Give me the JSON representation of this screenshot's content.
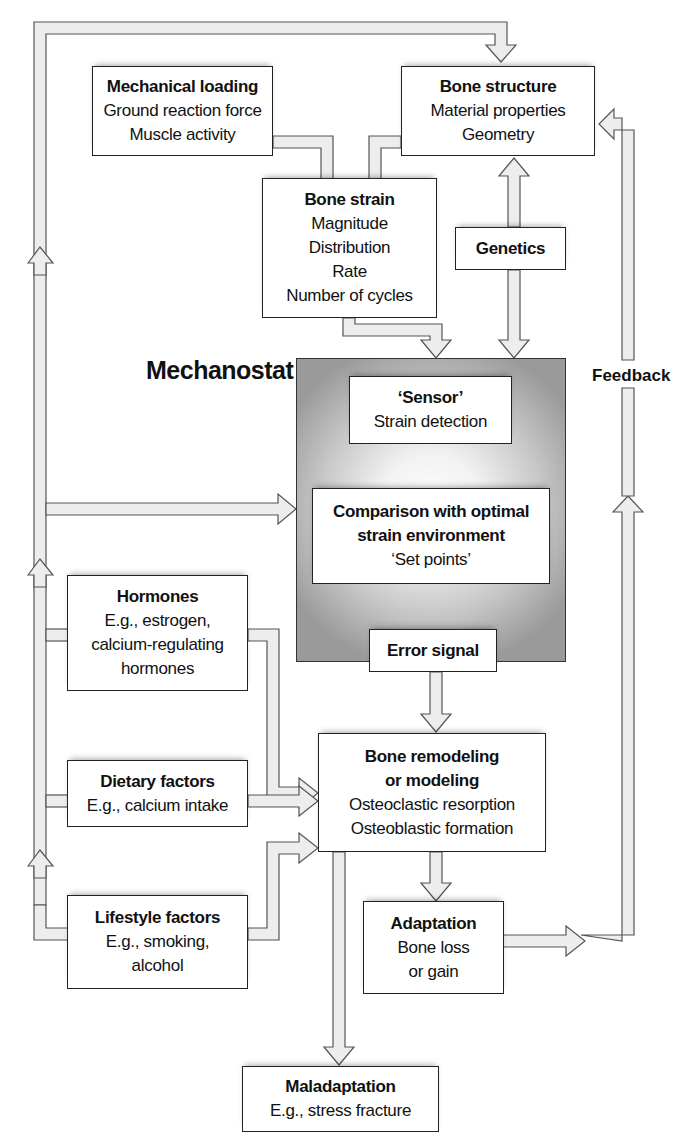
{
  "diagram": {
    "title": "Mechanostat",
    "feedback_label": "Feedback",
    "nodes": {
      "mechanical_loading": {
        "title": "Mechanical loading",
        "lines": [
          "Ground reaction force",
          "Muscle activity"
        ]
      },
      "bone_structure": {
        "title": "Bone structure",
        "lines": [
          "Material properties",
          "Geometry"
        ]
      },
      "bone_strain": {
        "title": "Bone strain",
        "lines": [
          "Magnitude",
          "Distribution",
          "Rate",
          "Number of cycles"
        ]
      },
      "genetics": {
        "title": "Genetics",
        "lines": []
      },
      "sensor": {
        "title": "‘Sensor’",
        "lines": [
          "Strain detection"
        ]
      },
      "comparison": {
        "title": "Comparison with optimal strain environment",
        "title_lines": [
          "Comparison with optimal",
          "strain environment"
        ],
        "lines": [
          "‘Set points’"
        ]
      },
      "error_signal": {
        "title": "Error signal",
        "lines": []
      },
      "hormones": {
        "title": "Hormones",
        "lines": [
          "E.g., estrogen,",
          "calcium-regulating",
          "hormones"
        ]
      },
      "dietary": {
        "title": "Dietary factors",
        "lines": [
          "E.g., calcium intake"
        ]
      },
      "lifestyle": {
        "title": "Lifestyle factors",
        "lines": [
          "E.g., smoking,",
          "alcohol"
        ]
      },
      "remodeling": {
        "title": "Bone remodeling or modeling",
        "title_lines": [
          "Bone remodeling",
          "or modeling"
        ],
        "lines": [
          "Osteoclastic resorption",
          "Osteoblastic formation"
        ]
      },
      "adaptation": {
        "title": "Adaptation",
        "lines": [
          "Bone loss",
          "or gain"
        ]
      },
      "maladaptation": {
        "title": "Maladaptation",
        "lines": [
          "E.g., stress fracture"
        ]
      }
    },
    "edges": [
      {
        "from": "mechanical_loading",
        "to": "bone_strain"
      },
      {
        "from": "bone_structure",
        "to": "bone_strain"
      },
      {
        "from": "genetics",
        "to": "bone_structure"
      },
      {
        "from": "genetics",
        "to": "mechanostat"
      },
      {
        "from": "bone_strain",
        "to": "sensor"
      },
      {
        "from": "sensor",
        "to": "comparison"
      },
      {
        "from": "comparison",
        "to": "error_signal"
      },
      {
        "from": "error_signal",
        "to": "remodeling"
      },
      {
        "from": "hormones",
        "to": "remodeling"
      },
      {
        "from": "dietary",
        "to": "remodeling"
      },
      {
        "from": "lifestyle",
        "to": "remodeling"
      },
      {
        "from": "hormones",
        "to": "comparison"
      },
      {
        "from": "dietary",
        "to": "comparison"
      },
      {
        "from": "lifestyle",
        "to": "bone_structure"
      },
      {
        "from": "remodeling",
        "to": "adaptation"
      },
      {
        "from": "remodeling",
        "to": "maladaptation"
      },
      {
        "from": "adaptation",
        "to": "bone_structure",
        "label": "Feedback"
      }
    ],
    "colors": {
      "box_border": "#222222",
      "arrow_fill": "#ededed",
      "arrow_stroke": "#555555",
      "panel_dark": "#9a9a9a",
      "panel_light": "#ffffff"
    }
  }
}
